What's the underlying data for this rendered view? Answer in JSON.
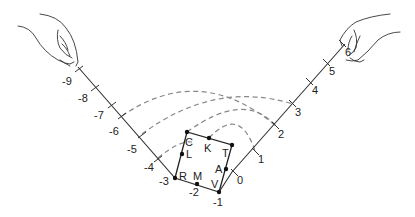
{
  "diagram": {
    "left_scale": [
      "-9",
      "-8",
      "-7",
      "-6",
      "-5",
      "-4",
      "-3",
      "-2"
    ],
    "right_scale": [
      "0",
      "1",
      "2",
      "3",
      "4",
      "5",
      "6"
    ],
    "vertex_label": "-1",
    "points": {
      "C": "C",
      "K": "K",
      "T": "T",
      "L": "L",
      "A": "A",
      "R": "R",
      "M": "M",
      "V": "V"
    },
    "colors": {
      "line": "#333333",
      "arc": "#888888",
      "background": "#ffffff"
    }
  }
}
